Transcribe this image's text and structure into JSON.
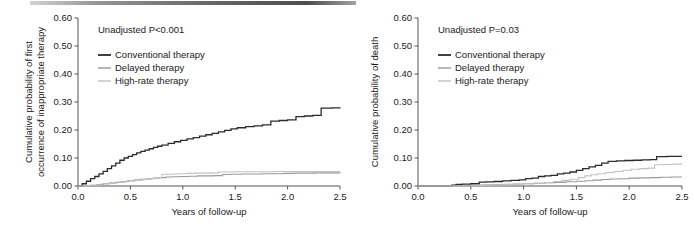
{
  "figure": {
    "panel_count": 2,
    "artifact": "scan-band-top"
  },
  "colors": {
    "conventional": "#2b2b2b",
    "delayed": "#9a9a9a",
    "high_rate": "#c2c2c2",
    "axis": "#555555",
    "text": "#1a1a1a"
  },
  "chart_data": [
    {
      "type": "line",
      "panel": "left",
      "title": "",
      "annotation": "Unadjusted P<0.001",
      "xlabel": "Years of follow-up",
      "ylabel": "Cumulative probability of first occurrence of inappropriate therapy",
      "ylabel_line1": "Cumulative probability of first",
      "ylabel_line2": "occurrence of inappropriate therapy",
      "xlim": [
        0.0,
        2.5
      ],
      "ylim": [
        0.0,
        0.6
      ],
      "xticks": [
        0.0,
        0.5,
        1.0,
        1.5,
        2.0,
        2.5
      ],
      "xtick_labels": [
        "0.0",
        "0.5",
        "1.0",
        "1.5",
        "2.0",
        "2.5"
      ],
      "yticks": [
        0.0,
        0.1,
        0.2,
        0.3,
        0.4,
        0.5,
        0.6
      ],
      "ytick_labels": [
        "0.00",
        "0.10",
        "0.20",
        "0.30",
        "0.40",
        "0.50",
        "0.60"
      ],
      "grid": false,
      "legend_position": "upper-left",
      "series": [
        {
          "name": "Conventional therapy",
          "color_key": "conventional",
          "width": 1.3,
          "x": [
            0.0,
            0.04,
            0.08,
            0.12,
            0.16,
            0.2,
            0.24,
            0.28,
            0.32,
            0.36,
            0.4,
            0.44,
            0.48,
            0.52,
            0.56,
            0.6,
            0.64,
            0.68,
            0.72,
            0.76,
            0.8,
            0.86,
            0.92,
            0.98,
            1.04,
            1.1,
            1.16,
            1.22,
            1.28,
            1.34,
            1.4,
            1.46,
            1.52,
            1.6,
            1.68,
            1.76,
            1.84,
            1.92,
            2.0,
            2.08,
            2.16,
            2.24,
            2.32,
            2.42,
            2.5
          ],
          "y": [
            0.0,
            0.008,
            0.017,
            0.026,
            0.034,
            0.043,
            0.052,
            0.062,
            0.072,
            0.082,
            0.092,
            0.1,
            0.106,
            0.112,
            0.118,
            0.124,
            0.128,
            0.133,
            0.138,
            0.142,
            0.146,
            0.152,
            0.158,
            0.163,
            0.168,
            0.173,
            0.178,
            0.183,
            0.188,
            0.193,
            0.199,
            0.204,
            0.208,
            0.212,
            0.215,
            0.218,
            0.232,
            0.234,
            0.236,
            0.248,
            0.25,
            0.252,
            0.278,
            0.279,
            0.28
          ],
          "final_value": 0.28
        },
        {
          "name": "Delayed therapy",
          "color_key": "delayed",
          "width": 1.1,
          "x": [
            0.0,
            0.1,
            0.18,
            0.24,
            0.3,
            0.36,
            0.42,
            0.48,
            0.54,
            0.6,
            0.66,
            0.72,
            0.78,
            0.84,
            0.9,
            0.98,
            1.06,
            1.14,
            1.22,
            1.3,
            1.38,
            1.46,
            1.56,
            1.66,
            1.76,
            1.86,
            1.96,
            2.06,
            2.16,
            2.26,
            2.38,
            2.5
          ],
          "y": [
            0.0,
            0.002,
            0.005,
            0.008,
            0.011,
            0.013,
            0.016,
            0.019,
            0.022,
            0.024,
            0.026,
            0.028,
            0.03,
            0.032,
            0.033,
            0.034,
            0.035,
            0.036,
            0.036,
            0.037,
            0.041,
            0.042,
            0.043,
            0.043,
            0.044,
            0.044,
            0.045,
            0.046,
            0.046,
            0.047,
            0.047,
            0.048
          ],
          "final_value": 0.048
        },
        {
          "name": "High-rate therapy",
          "color_key": "high_rate",
          "width": 1.1,
          "x": [
            0.0,
            0.12,
            0.22,
            0.3,
            0.38,
            0.46,
            0.54,
            0.62,
            0.7,
            0.76,
            0.8,
            0.84,
            0.9,
            0.96,
            1.04,
            1.12,
            1.2,
            1.28,
            1.34,
            1.42,
            1.5,
            1.6,
            1.7,
            1.8,
            1.9,
            2.0,
            2.12,
            2.24,
            2.36,
            2.5
          ],
          "y": [
            0.0,
            0.003,
            0.007,
            0.011,
            0.014,
            0.018,
            0.021,
            0.024,
            0.027,
            0.03,
            0.041,
            0.042,
            0.043,
            0.044,
            0.045,
            0.046,
            0.046,
            0.047,
            0.05,
            0.05,
            0.051,
            0.051,
            0.051,
            0.051,
            0.052,
            0.052,
            0.052,
            0.052,
            0.052,
            0.052
          ],
          "final_value": 0.052
        }
      ]
    },
    {
      "type": "line",
      "panel": "right",
      "title": "",
      "annotation": "Unadjusted P=0.03",
      "xlabel": "Years of follow-up",
      "ylabel": "Cumulative probability of death",
      "ylabel_line1": "Cumulative probability of death",
      "ylabel_line2": "",
      "xlim": [
        0.0,
        2.5
      ],
      "ylim": [
        0.0,
        0.6
      ],
      "xticks": [
        0.0,
        0.5,
        1.0,
        1.5,
        2.0,
        2.5
      ],
      "xtick_labels": [
        "0.0",
        "0.5",
        "1.0",
        "1.5",
        "2.0",
        "2.5"
      ],
      "yticks": [
        0.0,
        0.1,
        0.2,
        0.3,
        0.4,
        0.5,
        0.6
      ],
      "ytick_labels": [
        "0.00",
        "0.10",
        "0.20",
        "0.30",
        "0.40",
        "0.50",
        "0.60"
      ],
      "grid": false,
      "legend_position": "upper-left",
      "series": [
        {
          "name": "Conventional therapy",
          "color_key": "conventional",
          "width": 1.3,
          "x": [
            0.0,
            0.28,
            0.32,
            0.36,
            0.42,
            0.5,
            0.58,
            0.64,
            0.72,
            0.8,
            0.88,
            0.96,
            1.02,
            1.08,
            1.14,
            1.2,
            1.26,
            1.32,
            1.38,
            1.44,
            1.5,
            1.56,
            1.62,
            1.68,
            1.74,
            1.8,
            1.88,
            1.96,
            2.04,
            2.12,
            2.2,
            2.26,
            2.36,
            2.5
          ],
          "y": [
            0.0,
            0.0,
            0.003,
            0.006,
            0.007,
            0.008,
            0.014,
            0.015,
            0.016,
            0.018,
            0.02,
            0.022,
            0.026,
            0.028,
            0.034,
            0.036,
            0.038,
            0.043,
            0.046,
            0.05,
            0.056,
            0.062,
            0.068,
            0.074,
            0.082,
            0.088,
            0.09,
            0.091,
            0.092,
            0.093,
            0.094,
            0.105,
            0.106,
            0.106
          ],
          "final_value": 0.106
        },
        {
          "name": "Delayed therapy",
          "color_key": "delayed",
          "width": 1.1,
          "x": [
            0.0,
            0.42,
            0.48,
            0.56,
            0.66,
            0.74,
            0.82,
            0.9,
            1.0,
            1.1,
            1.2,
            1.3,
            1.4,
            1.5,
            1.58,
            1.66,
            1.74,
            1.82,
            1.9,
            2.0,
            2.1,
            2.2,
            2.3,
            2.4,
            2.5
          ],
          "y": [
            0.0,
            0.0,
            0.002,
            0.003,
            0.004,
            0.005,
            0.006,
            0.007,
            0.008,
            0.01,
            0.012,
            0.013,
            0.015,
            0.017,
            0.019,
            0.021,
            0.023,
            0.025,
            0.026,
            0.028,
            0.029,
            0.03,
            0.031,
            0.032,
            0.032
          ],
          "final_value": 0.032
        },
        {
          "name": "High-rate therapy",
          "color_key": "high_rate",
          "width": 1.1,
          "x": [
            0.0,
            0.46,
            0.54,
            0.62,
            0.7,
            0.8,
            0.9,
            1.0,
            1.1,
            1.2,
            1.28,
            1.36,
            1.44,
            1.52,
            1.58,
            1.64,
            1.7,
            1.78,
            1.86,
            1.94,
            2.02,
            2.1,
            2.18,
            2.24,
            2.32,
            2.42,
            2.5
          ],
          "y": [
            0.0,
            0.0,
            0.002,
            0.003,
            0.004,
            0.005,
            0.006,
            0.008,
            0.01,
            0.012,
            0.016,
            0.02,
            0.024,
            0.03,
            0.036,
            0.04,
            0.044,
            0.048,
            0.052,
            0.056,
            0.06,
            0.062,
            0.064,
            0.076,
            0.077,
            0.078,
            0.078
          ],
          "final_value": 0.078
        }
      ]
    }
  ]
}
